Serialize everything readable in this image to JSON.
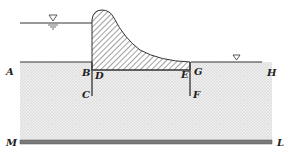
{
  "diagram": {
    "type": "dam seepage cross-section",
    "labels": {
      "A": "A",
      "B": "B",
      "C": "C",
      "D": "D",
      "E": "E",
      "F": "F",
      "G": "G",
      "H": "H",
      "M": "M",
      "L": "L"
    },
    "symbols": {
      "upstream_water_level": "water-level-triangle",
      "downstream_water_level": "water-level-triangle"
    },
    "colors": {
      "line": "#333333",
      "soil_fill": "#e4e4e4",
      "hatch": "#444444",
      "impervious": "#7a7a7a"
    }
  }
}
